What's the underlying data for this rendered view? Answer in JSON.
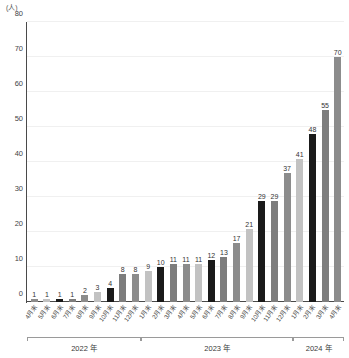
{
  "chart_data": {
    "type": "bar",
    "title": "",
    "xlabel": "",
    "ylabel": "",
    "unit_label": "(人)",
    "ylim": [
      0,
      80
    ],
    "yticks": [
      0,
      10,
      20,
      30,
      40,
      50,
      60,
      70,
      80
    ],
    "grid": true,
    "legend": "none",
    "categories": [
      "4月末",
      "5月末",
      "6月末",
      "7月末",
      "8月末",
      "9月末",
      "10月末",
      "11月末",
      "12月末",
      "1月末",
      "2月末",
      "3月末",
      "4月末",
      "5月末",
      "6月末",
      "7月末",
      "8月末",
      "9月末",
      "10月末",
      "11月末",
      "12月末",
      "1月末",
      "2月末",
      "3月末",
      "4月末"
    ],
    "values": [
      1,
      1,
      1,
      1,
      2,
      3,
      4,
      8,
      8,
      9,
      10,
      11,
      11,
      11,
      12,
      13,
      17,
      21,
      29,
      29,
      37,
      41,
      48,
      55,
      70
    ],
    "bar_colors": [
      "#8c8c8c",
      "#c2c2c2",
      "#1a1a1a",
      "#7d7d7d",
      "#8c8c8c",
      "#c2c2c2",
      "#1a1a1a",
      "#7d7d7d",
      "#8c8c8c",
      "#c2c2c2",
      "#1a1a1a",
      "#7d7d7d",
      "#8c8c8c",
      "#c2c2c2",
      "#1a1a1a",
      "#7d7d7d",
      "#8c8c8c",
      "#c2c2c2",
      "#1a1a1a",
      "#7d7d7d",
      "#8c8c8c",
      "#c2c2c2",
      "#1a1a1a",
      "#7d7d7d",
      "#8c8c8c"
    ],
    "year_groups": [
      {
        "label": "2022 年",
        "start_index": 0,
        "end_index": 8
      },
      {
        "label": "2023 年",
        "start_index": 9,
        "end_index": 20
      },
      {
        "label": "2024 年",
        "start_index": 21,
        "end_index": 24
      }
    ],
    "colors": {
      "axis": "#4a4a4a",
      "grid": "#f0f0f0",
      "text": "#444444",
      "background": "#ffffff"
    }
  }
}
